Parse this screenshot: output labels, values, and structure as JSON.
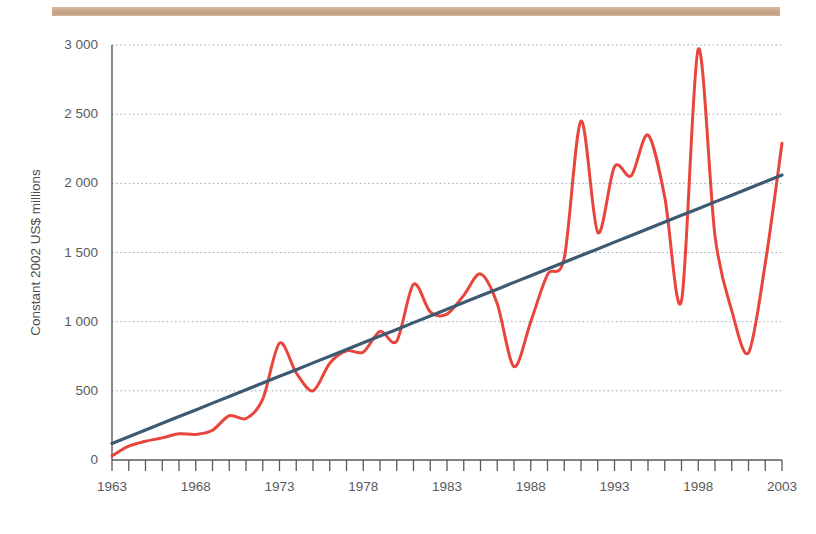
{
  "decor": {
    "top_rule_color": "#cdab8c"
  },
  "chart_data": {
    "type": "line",
    "title": "",
    "subtitle": "",
    "xlabel": "",
    "ylabel": "Constant 2002 US$ millions",
    "xlim": [
      1963,
      2003
    ],
    "ylim": [
      0,
      3000
    ],
    "grid": true,
    "grid_axis": "y",
    "legend": false,
    "legend_position": "none",
    "ytick_labels": [
      "0",
      "500",
      "1 000",
      "1 500",
      "2 000",
      "2 500",
      "3 000"
    ],
    "ytick_values": [
      0,
      500,
      1000,
      1500,
      2000,
      2500,
      3000
    ],
    "xtick_labels": [
      "1963",
      "1968",
      "1973",
      "1978",
      "1983",
      "1988",
      "1993",
      "1998",
      "2003"
    ],
    "xtick_values": [
      1963,
      1968,
      1973,
      1978,
      1983,
      1988,
      1993,
      1998,
      2003
    ],
    "minor_xticks_every": 1,
    "x": [
      1963,
      1964,
      1965,
      1966,
      1967,
      1968,
      1969,
      1970,
      1971,
      1972,
      1973,
      1974,
      1975,
      1976,
      1977,
      1978,
      1979,
      1980,
      1981,
      1982,
      1983,
      1984,
      1985,
      1986,
      1987,
      1988,
      1989,
      1990,
      1991,
      1992,
      1993,
      1994,
      1995,
      1996,
      1997,
      1998,
      1999,
      2000,
      2001,
      2002,
      2003
    ],
    "series": [
      {
        "name": "Annual value",
        "color": "#e8453c",
        "width": 3.0,
        "values": [
          30,
          100,
          135,
          160,
          190,
          185,
          215,
          320,
          300,
          440,
          845,
          630,
          500,
          700,
          790,
          780,
          930,
          860,
          1270,
          1070,
          1055,
          1190,
          1345,
          1130,
          675,
          1000,
          1340,
          1460,
          2450,
          1645,
          2120,
          2055,
          2350,
          1900,
          1150,
          2970,
          1620,
          1080,
          775,
          1420,
          2290
        ]
      },
      {
        "name": "Trend",
        "color": "#3d5a73",
        "width": 3.2,
        "values": [
          120,
          168,
          217,
          265,
          314,
          362,
          411,
          459,
          508,
          556,
          605,
          653,
          702,
          750,
          799,
          847,
          896,
          944,
          993,
          1041,
          1090,
          1138,
          1187,
          1235,
          1284,
          1332,
          1381,
          1429,
          1478,
          1526,
          1575,
          1623,
          1672,
          1720,
          1769,
          1817,
          1866,
          1914,
          1963,
          2011,
          2060
        ]
      }
    ]
  }
}
